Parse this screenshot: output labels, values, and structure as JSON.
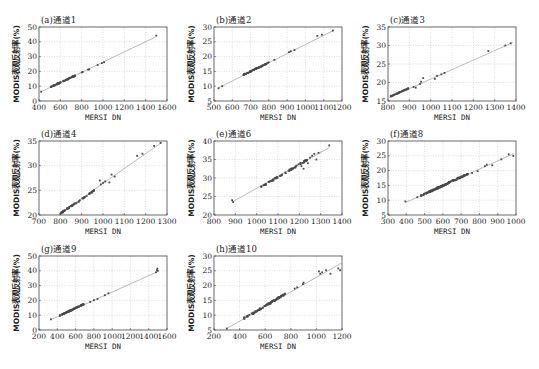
{
  "figure": {
    "xlabel": "MERSI DN",
    "ylabel": "MODIS表观反射率(%)"
  },
  "chart_data": [
    {
      "type": "scatter",
      "title": "(a)通道1",
      "xlabel": "MERSI DN",
      "ylabel": "MODIS表观反射率(%)",
      "xlim": [
        400,
        1600
      ],
      "ylim": [
        0,
        50
      ],
      "xticks": [
        400,
        600,
        800,
        1000,
        1200,
        1400,
        1600
      ],
      "yticks": [
        0,
        10,
        20,
        30,
        40,
        50
      ],
      "grid": true,
      "fit_line": {
        "x": [
          420,
          1500
        ],
        "y": [
          6.3,
          43.5
        ]
      },
      "cluster": {
        "x_range": [
          510,
          740
        ],
        "y_range": [
          9.5,
          17.2
        ],
        "count": 70
      },
      "points": [
        [
          420,
          6.3
        ],
        [
          800,
          19.3
        ],
        [
          810,
          19.6
        ],
        [
          860,
          21.2
        ],
        [
          870,
          21.4
        ],
        [
          950,
          24.3
        ],
        [
          990,
          25.6
        ],
        [
          1010,
          26.2
        ],
        [
          1500,
          44.2
        ]
      ]
    },
    {
      "type": "scatter",
      "title": "(b)通道2",
      "xlabel": "MERSI DN",
      "ylabel": "MODIS表观反射率(%)",
      "xlim": [
        500,
        1200
      ],
      "ylim": [
        5,
        30
      ],
      "xticks": [
        500,
        600,
        700,
        800,
        900,
        1000,
        1100,
        1200
      ],
      "yticks": [
        5,
        10,
        15,
        20,
        25,
        30
      ],
      "grid": true,
      "fit_line": {
        "x": [
          520,
          1160
        ],
        "y": [
          9.3,
          29.0
        ]
      },
      "cluster": {
        "x_range": [
          660,
          800
        ],
        "y_range": [
          13.8,
          18.0
        ],
        "count": 70
      },
      "points": [
        [
          525,
          9.3
        ],
        [
          545,
          10.0
        ],
        [
          830,
          18.9
        ],
        [
          910,
          21.5
        ],
        [
          920,
          21.8
        ],
        [
          940,
          22.2
        ],
        [
          1065,
          27.0
        ],
        [
          1090,
          27.4
        ],
        [
          1150,
          28.8
        ]
      ]
    },
    {
      "type": "scatter",
      "title": "(c)通道3",
      "xlabel": "MERSI DN",
      "ylabel": "MODIS表观反射率(%)",
      "xlim": [
        800,
        1400
      ],
      "ylim": [
        15,
        35
      ],
      "xticks": [
        800,
        900,
        1000,
        1100,
        1200,
        1300,
        1400
      ],
      "yticks": [
        15,
        20,
        25,
        30,
        35
      ],
      "grid": true,
      "fit_line": {
        "x": [
          805,
          1385
        ],
        "y": [
          15.9,
          30.8
        ]
      },
      "cluster": {
        "x_range": [
          810,
          900
        ],
        "y_range": [
          16.2,
          18.5
        ],
        "count": 40
      },
      "points": [
        [
          920,
          18.8
        ],
        [
          930,
          18.6
        ],
        [
          950,
          19.6
        ],
        [
          955,
          20.2
        ],
        [
          965,
          21.2
        ],
        [
          1020,
          21.0
        ],
        [
          1030,
          21.8
        ],
        [
          1050,
          22.2
        ],
        [
          1065,
          22.6
        ],
        [
          1270,
          28.5
        ],
        [
          1350,
          30.0
        ],
        [
          1375,
          30.6
        ]
      ]
    },
    {
      "type": "scatter",
      "title": "(d)通道4",
      "xlabel": "MERSI DN",
      "ylabel": "MODIS表观反射率(%)",
      "xlim": [
        700,
        1300
      ],
      "ylim": [
        20,
        35
      ],
      "xticks": [
        700,
        800,
        900,
        1000,
        1100,
        1200,
        1300
      ],
      "yticks": [
        20,
        25,
        30,
        35
      ],
      "grid": true,
      "fit_line": {
        "x": [
          795,
          1275
        ],
        "y": [
          20.2,
          34.7
        ]
      },
      "cluster": {
        "x_range": [
          800,
          960
        ],
        "y_range": [
          20.3,
          25.0
        ],
        "count": 60
      },
      "points": [
        [
          985,
          27.0
        ],
        [
          990,
          26.2
        ],
        [
          1000,
          26.5
        ],
        [
          1010,
          26.8
        ],
        [
          1030,
          26.6
        ],
        [
          1040,
          28.2
        ],
        [
          1055,
          27.8
        ],
        [
          1160,
          32.0
        ],
        [
          1185,
          32.4
        ],
        [
          1240,
          34.0
        ],
        [
          1270,
          34.6
        ]
      ]
    },
    {
      "type": "scatter",
      "title": "(e)通道6",
      "xlabel": "MERSI DN",
      "ylabel": "MODIS表观反射率(%)",
      "xlim": [
        800,
        1400
      ],
      "ylim": [
        20,
        40
      ],
      "xticks": [
        800,
        900,
        1000,
        1100,
        1200,
        1300,
        1400
      ],
      "yticks": [
        20,
        25,
        30,
        35,
        40
      ],
      "grid": true,
      "fit_line": {
        "x": [
          885,
          1340
        ],
        "y": [
          23.5,
          38.2
        ]
      },
      "cluster": {
        "x_range": [
          1020,
          1240
        ],
        "y_range": [
          27.5,
          35.0
        ],
        "count": 70
      },
      "points": [
        [
          885,
          24.0
        ],
        [
          890,
          23.5
        ],
        [
          1210,
          33.2
        ],
        [
          1220,
          32.5
        ],
        [
          1240,
          34.0
        ],
        [
          1250,
          35.5
        ],
        [
          1260,
          36.0
        ],
        [
          1270,
          36.5
        ],
        [
          1280,
          35.0
        ],
        [
          1290,
          36.8
        ],
        [
          1340,
          38.8
        ]
      ]
    },
    {
      "type": "scatter",
      "title": "(f)通道8",
      "xlabel": "MERSI DN",
      "ylabel": "MODIS表观反射率(%)",
      "xlim": [
        300,
        1000
      ],
      "ylim": [
        5,
        30
      ],
      "xticks": [
        300,
        400,
        500,
        600,
        700,
        800,
        900,
        1000
      ],
      "yticks": [
        5,
        10,
        15,
        20,
        25,
        30
      ],
      "grid": true,
      "fit_line": {
        "x": [
          395,
          990
        ],
        "y": [
          9.2,
          25.8
        ]
      },
      "cluster": {
        "x_range": [
          480,
          740
        ],
        "y_range": [
          11.5,
          19.0
        ],
        "count": 140
      },
      "points": [
        [
          395,
          9.6
        ],
        [
          460,
          11.0
        ],
        [
          760,
          19.2
        ],
        [
          790,
          19.8
        ],
        [
          830,
          21.5
        ],
        [
          840,
          22.0
        ],
        [
          870,
          21.8
        ],
        [
          920,
          23.8
        ],
        [
          960,
          25.5
        ],
        [
          985,
          25.0
        ]
      ]
    },
    {
      "type": "scatter",
      "title": "(g)通道9",
      "xlabel": "MERSI DN",
      "ylabel": "MODIS表观反射率(%)",
      "xlim": [
        200,
        1600
      ],
      "ylim": [
        0,
        50
      ],
      "xticks": [
        200,
        400,
        600,
        800,
        1000,
        1200,
        1400,
        1600
      ],
      "yticks": [
        0,
        10,
        20,
        30,
        40,
        50
      ],
      "grid": true,
      "fit_line": {
        "x": [
          330,
          1500
        ],
        "y": [
          7.0,
          39.5
        ]
      },
      "cluster": {
        "x_range": [
          420,
          690
        ],
        "y_range": [
          9.5,
          17.5
        ],
        "count": 70
      },
      "points": [
        [
          330,
          7.2
        ],
        [
          760,
          19.0
        ],
        [
          800,
          20.2
        ],
        [
          840,
          21.0
        ],
        [
          920,
          23.5
        ],
        [
          960,
          24.8
        ],
        [
          1480,
          39.0
        ],
        [
          1490,
          40.5
        ],
        [
          1495,
          41.5
        ],
        [
          1500,
          40.0
        ]
      ]
    },
    {
      "type": "scatter",
      "title": "(h)通道10",
      "xlabel": "MERSI DN",
      "ylabel": "MODIS表观反射率(%)",
      "xlim": [
        200,
        1200
      ],
      "ylim": [
        5,
        30
      ],
      "xticks": [
        200,
        400,
        600,
        800,
        1000,
        1200
      ],
      "yticks": [
        5,
        10,
        15,
        20,
        25,
        30
      ],
      "grid": true,
      "fit_line": {
        "x": [
          300,
          1190
        ],
        "y": [
          5.5,
          27.5
        ]
      },
      "cluster": {
        "x_range": [
          430,
          760
        ],
        "y_range": [
          8.8,
          17.2
        ],
        "count": 90
      },
      "points": [
        [
          300,
          5.5
        ],
        [
          830,
          19.0
        ],
        [
          850,
          19.4
        ],
        [
          895,
          20.5
        ],
        [
          900,
          21.0
        ],
        [
          1020,
          24.8
        ],
        [
          1030,
          24.0
        ],
        [
          1045,
          24.5
        ],
        [
          1075,
          25.2
        ],
        [
          1110,
          24.0
        ],
        [
          1170,
          25.8
        ],
        [
          1185,
          25.2
        ]
      ]
    }
  ]
}
